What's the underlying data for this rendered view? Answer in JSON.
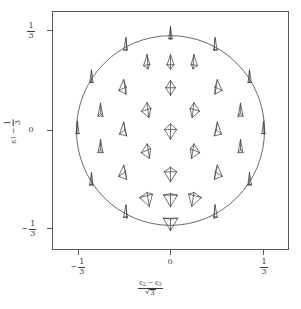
{
  "figure": {
    "kind": "glyph-field-plot",
    "background": "#ffffff",
    "line_color": "#555a5e",
    "glyph_color": "#3f4347",
    "text_color": "#3a3d40"
  },
  "axes": {
    "x": {
      "label_parts": {
        "numerator_first": "ε",
        "numerator_first_sub": "2",
        "operator": "−",
        "numerator_second": "ε",
        "numerator_second_sub": "3",
        "denominator_radical": "√",
        "denominator_radicand": "3"
      },
      "label_text": "(ε2 − ε3)/√3",
      "ticks": [
        {
          "value": -0.3333,
          "label": "-1/3",
          "sign": "−",
          "num": "1",
          "den": "3",
          "px": 78
        },
        {
          "value": 0.0,
          "label": "0",
          "sign": "",
          "num": "",
          "den": "",
          "px": 170
        },
        {
          "value": 0.3333,
          "label": "1/3",
          "sign": "",
          "num": "1",
          "den": "3",
          "px": 263
        }
      ],
      "range": [
        -0.42,
        0.42
      ]
    },
    "y": {
      "label_parts": {
        "symbol": "ε",
        "symbol_sub": "1",
        "operator": "−",
        "numerator": "1",
        "denominator": "3"
      },
      "label_text": "ε1 − 1/3",
      "ticks": [
        {
          "value": 0.3333,
          "label": "1/3",
          "sign": "",
          "num": "1",
          "den": "3",
          "px": 30
        },
        {
          "value": 0.0,
          "label": "0",
          "sign": "",
          "num": "",
          "den": "",
          "px": 130
        },
        {
          "value": -0.3333,
          "label": "-1/3",
          "sign": "−",
          "num": "1",
          "den": "3",
          "px": 228
        }
      ],
      "range": [
        -0.42,
        0.42
      ]
    }
  },
  "chart_data": {
    "type": "scatter",
    "title": "",
    "xlabel": "(ε2 − ε3)/√3",
    "ylabel": "ε1 − 1/3",
    "xlim": [
      -0.42,
      0.42
    ],
    "ylim": [
      -0.42,
      0.42
    ],
    "grid": false,
    "legend": null,
    "boundary": {
      "shape": "circle",
      "center": [
        0.0,
        0.0
      ],
      "radius": 0.3333,
      "note": "unit-circle boundary of the barycentric eigenvalue domain"
    },
    "marker": "tetrahedron-wireframe",
    "marker_note": "each sample position carries a wireframe tetrahedron whose 3D orientation varies with position",
    "points": [
      {
        "x": 0.0,
        "y": 0.333,
        "tilt": 88,
        "yaw": 0,
        "scale": 1.0,
        "flat": 0.05
      },
      {
        "x": -0.158,
        "y": 0.294,
        "tilt": 86,
        "yaw": 24,
        "scale": 1.0,
        "flat": 0.08
      },
      {
        "x": 0.158,
        "y": 0.294,
        "tilt": 86,
        "yaw": -24,
        "scale": 1.0,
        "flat": 0.08
      },
      {
        "x": -0.083,
        "y": 0.236,
        "tilt": 72,
        "yaw": 14,
        "scale": 1.0,
        "flat": 0.3
      },
      {
        "x": 0.0,
        "y": 0.236,
        "tilt": 70,
        "yaw": 0,
        "scale": 1.0,
        "flat": 0.34
      },
      {
        "x": 0.083,
        "y": 0.236,
        "tilt": 72,
        "yaw": -14,
        "scale": 1.0,
        "flat": 0.3
      },
      {
        "x": -0.28,
        "y": 0.18,
        "tilt": 88,
        "yaw": 48,
        "scale": 1.0,
        "flat": 0.05
      },
      {
        "x": 0.28,
        "y": 0.18,
        "tilt": 88,
        "yaw": -48,
        "scale": 1.0,
        "flat": 0.05
      },
      {
        "x": -0.166,
        "y": 0.15,
        "tilt": 62,
        "yaw": 30,
        "scale": 1.0,
        "flat": 0.45
      },
      {
        "x": 0.0,
        "y": 0.15,
        "tilt": 54,
        "yaw": 0,
        "scale": 1.0,
        "flat": 0.56
      },
      {
        "x": 0.166,
        "y": 0.15,
        "tilt": 62,
        "yaw": -30,
        "scale": 1.0,
        "flat": 0.45
      },
      {
        "x": -0.083,
        "y": 0.072,
        "tilt": 52,
        "yaw": 18,
        "scale": 1.0,
        "flat": 0.58
      },
      {
        "x": 0.083,
        "y": 0.072,
        "tilt": 52,
        "yaw": -18,
        "scale": 1.0,
        "flat": 0.58
      },
      {
        "x": -0.248,
        "y": 0.064,
        "tilt": 78,
        "yaw": 56,
        "scale": 1.0,
        "flat": 0.18
      },
      {
        "x": 0.248,
        "y": 0.064,
        "tilt": 78,
        "yaw": -56,
        "scale": 1.0,
        "flat": 0.18
      },
      {
        "x": -0.33,
        "y": 0.0,
        "tilt": 90,
        "yaw": 70,
        "scale": 1.0,
        "flat": 0.03
      },
      {
        "x": -0.166,
        "y": 0.0,
        "tilt": 66,
        "yaw": 44,
        "scale": 1.0,
        "flat": 0.38
      },
      {
        "x": 0.0,
        "y": 0.0,
        "tilt": 44,
        "yaw": 0,
        "scale": 1.05,
        "flat": 0.72
      },
      {
        "x": 0.166,
        "y": 0.0,
        "tilt": 66,
        "yaw": -44,
        "scale": 1.0,
        "flat": 0.38
      },
      {
        "x": 0.33,
        "y": 0.0,
        "tilt": 90,
        "yaw": -70,
        "scale": 1.0,
        "flat": 0.03
      },
      {
        "x": -0.083,
        "y": -0.072,
        "tilt": 50,
        "yaw": 24,
        "scale": 1.0,
        "flat": 0.6
      },
      {
        "x": 0.083,
        "y": -0.072,
        "tilt": 50,
        "yaw": -24,
        "scale": 1.0,
        "flat": 0.6
      },
      {
        "x": -0.248,
        "y": -0.064,
        "tilt": 78,
        "yaw": 60,
        "scale": 1.0,
        "flat": 0.18
      },
      {
        "x": 0.248,
        "y": -0.064,
        "tilt": 78,
        "yaw": -60,
        "scale": 1.0,
        "flat": 0.18
      },
      {
        "x": -0.166,
        "y": -0.15,
        "tilt": 60,
        "yaw": 36,
        "scale": 1.0,
        "flat": 0.48
      },
      {
        "x": 0.0,
        "y": -0.15,
        "tilt": 40,
        "yaw": 0,
        "scale": 1.0,
        "flat": 0.78
      },
      {
        "x": 0.166,
        "y": -0.15,
        "tilt": 60,
        "yaw": -36,
        "scale": 1.0,
        "flat": 0.48
      },
      {
        "x": -0.28,
        "y": -0.18,
        "tilt": 86,
        "yaw": 52,
        "scale": 1.0,
        "flat": 0.07
      },
      {
        "x": 0.28,
        "y": -0.18,
        "tilt": 86,
        "yaw": -52,
        "scale": 1.0,
        "flat": 0.07
      },
      {
        "x": -0.083,
        "y": -0.236,
        "tilt": 34,
        "yaw": 16,
        "scale": 1.0,
        "flat": 0.86
      },
      {
        "x": 0.083,
        "y": -0.236,
        "tilt": 34,
        "yaw": -16,
        "scale": 1.0,
        "flat": 0.86
      },
      {
        "x": 0.0,
        "y": -0.236,
        "tilt": 26,
        "yaw": 0,
        "scale": 1.0,
        "flat": 0.9
      },
      {
        "x": -0.158,
        "y": -0.294,
        "tilt": 84,
        "yaw": 28,
        "scale": 1.0,
        "flat": 0.1
      },
      {
        "x": 0.158,
        "y": -0.294,
        "tilt": 84,
        "yaw": -28,
        "scale": 1.0,
        "flat": 0.1
      },
      {
        "x": 0.0,
        "y": -0.32,
        "tilt": 16,
        "yaw": 0,
        "scale": 1.0,
        "flat": 0.95
      }
    ]
  }
}
